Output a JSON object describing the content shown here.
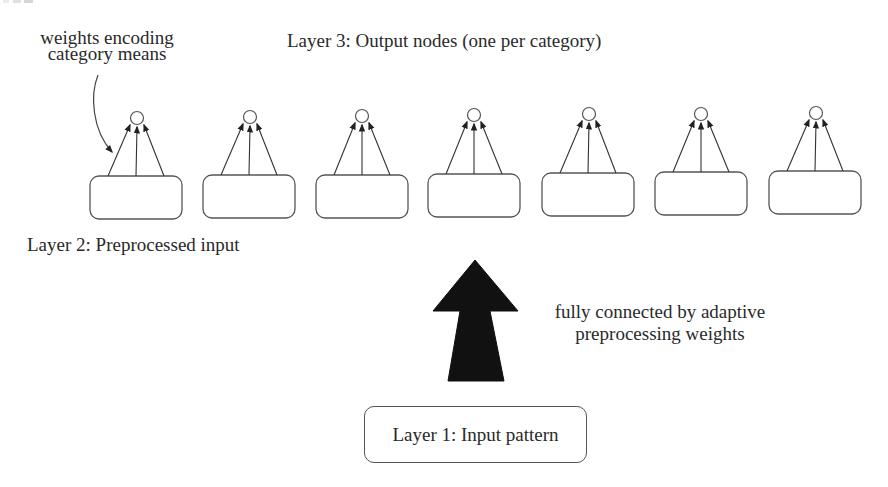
{
  "diagram": {
    "layer3_label": "Layer 3: Output nodes (one per category)",
    "layer2_label": "Layer 2: Preprocessed input",
    "layer1_label": "Layer 1: Input pattern",
    "annotation_weights": {
      "line1": "weights encoding",
      "line2": "category means"
    },
    "annotation_connection": {
      "line1": "fully connected by adaptive",
      "line2": "preprocessing weights"
    },
    "categories_count": 7,
    "units": [
      {
        "box_x": 90,
        "box_y": 176,
        "node_x": 137,
        "node_y": 118
      },
      {
        "box_x": 203,
        "box_y": 175,
        "node_x": 250,
        "node_y": 117
      },
      {
        "box_x": 316,
        "box_y": 175,
        "node_x": 362,
        "node_y": 116
      },
      {
        "box_x": 428,
        "box_y": 174,
        "node_x": 474,
        "node_y": 115
      },
      {
        "box_x": 542,
        "box_y": 173,
        "node_x": 589,
        "node_y": 114
      },
      {
        "box_x": 655,
        "box_y": 172,
        "node_x": 701,
        "node_y": 114
      },
      {
        "box_x": 769,
        "box_y": 171,
        "node_x": 816,
        "node_y": 113
      }
    ],
    "colors": {
      "stroke": "#555555",
      "text": "#2a2a2a",
      "big_arrow": "#111111",
      "background": "#ffffff"
    }
  }
}
